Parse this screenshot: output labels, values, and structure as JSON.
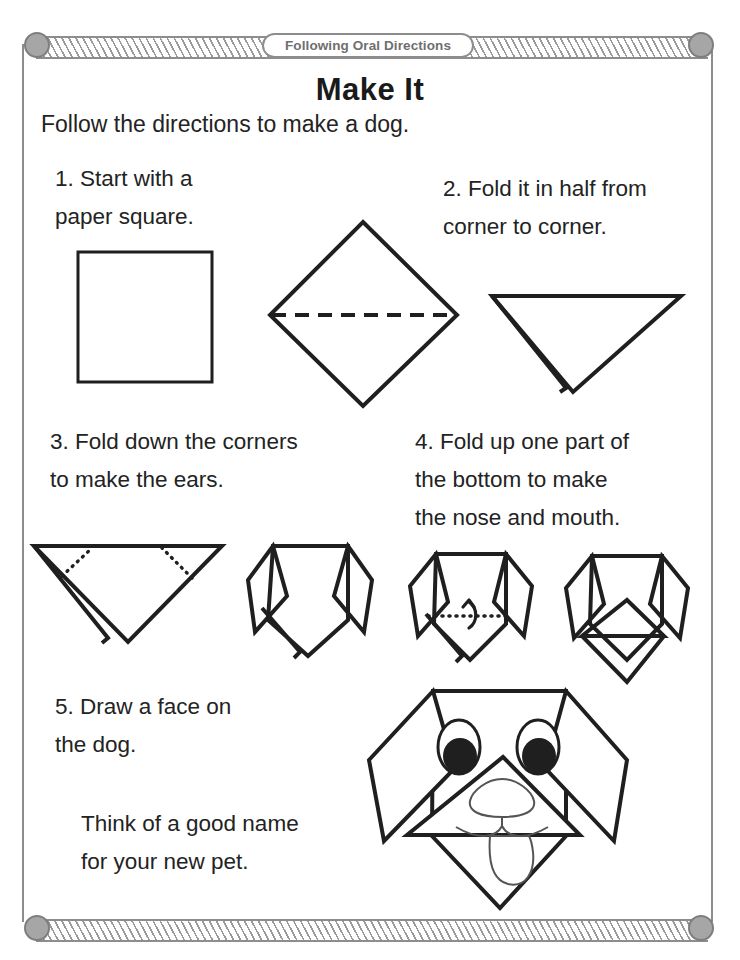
{
  "page": {
    "banner_label": "Following Oral Directions",
    "title": "Make It",
    "intro": "Follow the directions to make a dog.",
    "colors": {
      "ink": "#232323",
      "frame": "#8d8d8d",
      "bolt": "#a6a6a6",
      "banner_text": "#6f6f6f"
    }
  },
  "steps": [
    {
      "number": "1.",
      "text": "1. Start with a\n     paper square."
    },
    {
      "number": "2.",
      "text": "2. Fold it in half from\n     corner to corner."
    },
    {
      "number": "3.",
      "text": "3. Fold down the corners\n      to make the ears."
    },
    {
      "number": "4.",
      "text": "4. Fold up one part of\n     the bottom to make\n     the nose and mouth."
    },
    {
      "number": "5.",
      "text": "5. Draw a face on\n     the dog."
    }
  ],
  "closing_note": "Think of a good name\nfor your new pet.",
  "figures": [
    {
      "name": "paper-square",
      "caption_step": "1"
    },
    {
      "name": "diamond-with-fold-line",
      "caption_step": "2"
    },
    {
      "name": "folded-triangle",
      "caption_step": "2"
    },
    {
      "name": "triangle-with-ear-fold-lines",
      "caption_step": "3"
    },
    {
      "name": "head-with-ears",
      "caption_step": "3"
    },
    {
      "name": "head-with-muzzle-fold-line",
      "caption_step": "4"
    },
    {
      "name": "head-with-muzzle-folded",
      "caption_step": "4"
    },
    {
      "name": "finished-dog-face",
      "caption_step": "5"
    }
  ]
}
